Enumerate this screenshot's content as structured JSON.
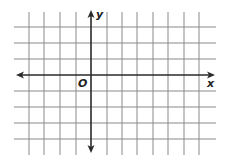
{
  "diagram": {
    "type": "coordinate-grid",
    "x_axis_label": "x",
    "y_axis_label": "y",
    "origin_label": "O",
    "colors": {
      "grid": "#8a8a8a",
      "axis": "#2a2a2a",
      "background": "#ffffff"
    },
    "grid": {
      "vertical_lines_x": [
        29,
        44,
        60,
        76,
        107,
        122,
        137,
        153,
        168,
        184,
        199
      ],
      "horizontal_lines_y": [
        27,
        43,
        59,
        91,
        107,
        123,
        139
      ],
      "vertical_span": [
        12,
        155
      ],
      "horizontal_span": [
        14,
        216
      ]
    },
    "axes": {
      "x_axis": {
        "y": 75,
        "from": 16,
        "to": 215,
        "arrows": "both"
      },
      "y_axis": {
        "x": 91,
        "from": 10,
        "to": 153,
        "arrows": "both"
      }
    },
    "units_left_of_origin": 4,
    "units_right_of_origin": 7,
    "units_above_origin": 3,
    "units_below_origin": 4
  }
}
